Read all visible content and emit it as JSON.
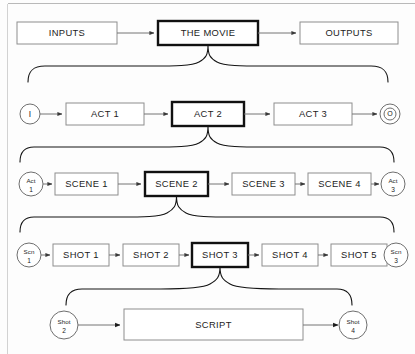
{
  "diagram": {
    "colors": {
      "background": "#fdfdfd",
      "box_stroke": "#8e8e8e",
      "emphasis_stroke": "#111111",
      "connector": "#757575",
      "brace": "#141414",
      "text": "#1c1c1c"
    },
    "rows": [
      {
        "id": "row-movie",
        "name": "movie-row",
        "boxes": [
          {
            "id": "inputs",
            "label": "INPUTS",
            "emphasis": false
          },
          {
            "id": "the-movie",
            "label": "THE MOVIE",
            "emphasis": true
          },
          {
            "id": "outputs",
            "label": "OUTPUTS",
            "emphasis": false
          }
        ],
        "terminals": []
      },
      {
        "id": "row-act",
        "name": "act-row",
        "start_terminal": {
          "id": "terminal-i",
          "label": "I",
          "shape": "circle"
        },
        "end_terminal": {
          "id": "terminal-o",
          "label": "O",
          "shape": "double-circle"
        },
        "boxes": [
          {
            "id": "act-1",
            "label": "ACT 1",
            "emphasis": false
          },
          {
            "id": "act-2",
            "label": "ACT 2",
            "emphasis": true
          },
          {
            "id": "act-3",
            "label": "ACT 3",
            "emphasis": false
          }
        ]
      },
      {
        "id": "row-scene",
        "name": "scene-row",
        "start_terminal": {
          "id": "node-act-1",
          "label_top": "Act",
          "label_bottom": "1",
          "shape": "circle"
        },
        "end_terminal": {
          "id": "node-act-3",
          "label_top": "Act",
          "label_bottom": "3",
          "shape": "circle"
        },
        "boxes": [
          {
            "id": "scene-1",
            "label": "SCENE 1",
            "emphasis": false
          },
          {
            "id": "scene-2",
            "label": "SCENE 2",
            "emphasis": true
          },
          {
            "id": "scene-3",
            "label": "SCENE 3",
            "emphasis": false
          },
          {
            "id": "scene-4",
            "label": "SCENE 4",
            "emphasis": false
          }
        ]
      },
      {
        "id": "row-shot",
        "name": "shot-row",
        "start_terminal": {
          "id": "node-scn-1",
          "label_top": "Scn",
          "label_bottom": "1",
          "shape": "circle"
        },
        "end_terminal": {
          "id": "node-scn-3",
          "label_top": "Scn",
          "label_bottom": "3",
          "shape": "circle"
        },
        "boxes": [
          {
            "id": "shot-1",
            "label": "SHOT 1",
            "emphasis": false
          },
          {
            "id": "shot-2",
            "label": "SHOT 2",
            "emphasis": false
          },
          {
            "id": "shot-3",
            "label": "SHOT 3",
            "emphasis": true
          },
          {
            "id": "shot-4",
            "label": "SHOT 4",
            "emphasis": false
          },
          {
            "id": "shot-5",
            "label": "SHOT 5",
            "emphasis": false
          }
        ]
      },
      {
        "id": "row-script",
        "name": "script-row",
        "start_terminal": {
          "id": "node-shot-2",
          "label_top": "Shot",
          "label_bottom": "2",
          "shape": "circle"
        },
        "end_terminal": {
          "id": "node-shot-4",
          "label_top": "Shot",
          "label_bottom": "4",
          "shape": "circle"
        },
        "boxes": [
          {
            "id": "script",
            "label": "SCRIPT",
            "emphasis": false
          }
        ]
      }
    ],
    "braces": [
      {
        "id": "brace-movie-to-act",
        "from": "the-movie",
        "to": "act-row"
      },
      {
        "id": "brace-act-to-scene",
        "from": "act-2",
        "to": "scene-row"
      },
      {
        "id": "brace-scene-to-shot",
        "from": "scene-2",
        "to": "shot-row"
      },
      {
        "id": "brace-shot-to-script",
        "from": "shot-3",
        "to": "script-row"
      }
    ]
  }
}
